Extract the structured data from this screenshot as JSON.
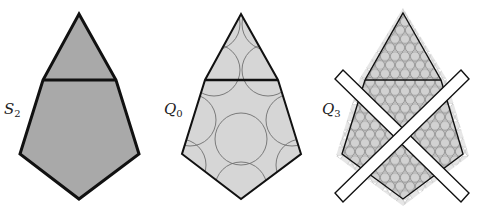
{
  "figure": {
    "panels": [
      {
        "id": "s2",
        "label": "S",
        "subscript": "2",
        "fill": "#a9a9a9"
      },
      {
        "id": "q0",
        "label": "Q",
        "subscript": "0",
        "fill": "#d6d6d6"
      },
      {
        "id": "q3",
        "label": "Q",
        "subscript": "3",
        "fill": "#bdbdbd"
      }
    ]
  },
  "colors": {
    "outline": "#111111",
    "circle_stroke": "#777777",
    "bar_fill": "#ffffff"
  }
}
